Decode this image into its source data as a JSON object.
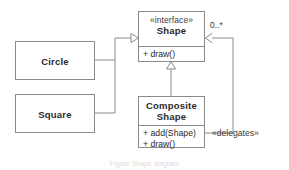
{
  "diagram": {
    "background_color": "#ffffff",
    "line_color": "#8a8a8a",
    "text_color": "#2b2b2b",
    "caption": "Figure  Shape  diagram"
  },
  "classes": {
    "shape": {
      "stereotype": "«interface»",
      "name": "Shape",
      "operations": [
        "+ draw()"
      ]
    },
    "composite_shape": {
      "name_line1": "Composite",
      "name_line2": "Shape",
      "operations": [
        "+ add(Shape)",
        "+ draw()"
      ]
    },
    "circle": {
      "name": "Circle"
    },
    "square": {
      "name": "Square"
    }
  },
  "relationships": {
    "multiplicity": "0..*",
    "delegates": "«delegates»"
  }
}
